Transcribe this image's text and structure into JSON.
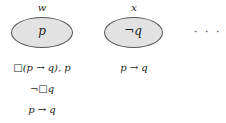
{
  "worlds": [
    {
      "label": "w",
      "content": "p",
      "formulas_below": [
        "□(p → q), p",
        "¬□q",
        "p → q"
      ]
    },
    {
      "label": "x",
      "content": "¬q",
      "formulas_below": [
        "p → q"
      ]
    }
  ],
  "continuation": "· · ·",
  "colors": {
    "ellipse_fill": "#e2e2e2",
    "ellipse_stroke": "#555555"
  }
}
